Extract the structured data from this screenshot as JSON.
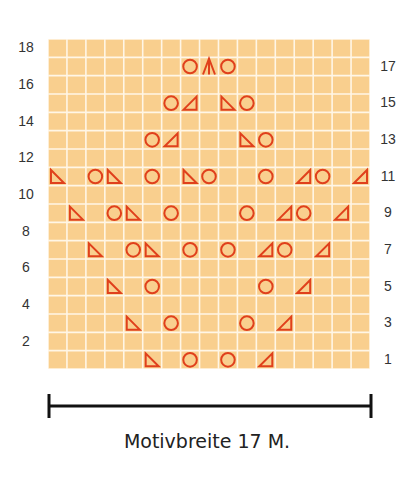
{
  "chart": {
    "columns": 17,
    "rows": 18,
    "colors": {
      "background": "#f9cf8e",
      "grid": "#fff6e6",
      "symbol": "#e0401c"
    },
    "left_labels": [
      "2",
      "4",
      "6",
      "8",
      "10",
      "12",
      "14",
      "16",
      "18"
    ],
    "right_labels": [
      "1",
      "3",
      "5",
      "7",
      "9",
      "11",
      "13",
      "15",
      "17"
    ],
    "legend_symbols": {
      "O": "yarn-over",
      "R": "right-leaning-decrease (◺)",
      "L": "left-leaning-decrease (◿)",
      "A": "double-decrease (Λ)"
    },
    "symbol_rows": [
      {
        "row": 1,
        "cells": [
          [
            6,
            "R"
          ],
          [
            8,
            "O"
          ],
          [
            10,
            "O"
          ],
          [
            12,
            "L"
          ]
        ]
      },
      {
        "row": 3,
        "cells": [
          [
            5,
            "R"
          ],
          [
            7,
            "O"
          ],
          [
            11,
            "O"
          ],
          [
            13,
            "L"
          ]
        ]
      },
      {
        "row": 5,
        "cells": [
          [
            4,
            "R"
          ],
          [
            6,
            "O"
          ],
          [
            12,
            "O"
          ],
          [
            14,
            "L"
          ]
        ]
      },
      {
        "row": 7,
        "cells": [
          [
            3,
            "R"
          ],
          [
            5,
            "O"
          ],
          [
            6,
            "R"
          ],
          [
            8,
            "O"
          ],
          [
            10,
            "O"
          ],
          [
            12,
            "L"
          ],
          [
            13,
            "O"
          ],
          [
            15,
            "L"
          ]
        ]
      },
      {
        "row": 9,
        "cells": [
          [
            2,
            "R"
          ],
          [
            4,
            "O"
          ],
          [
            5,
            "R"
          ],
          [
            7,
            "O"
          ],
          [
            11,
            "O"
          ],
          [
            13,
            "L"
          ],
          [
            14,
            "O"
          ],
          [
            16,
            "L"
          ]
        ]
      },
      {
        "row": 11,
        "cells": [
          [
            1,
            "R"
          ],
          [
            3,
            "O"
          ],
          [
            4,
            "R"
          ],
          [
            6,
            "O"
          ],
          [
            8,
            "R"
          ],
          [
            9,
            "O"
          ],
          [
            12,
            "O"
          ],
          [
            14,
            "L"
          ],
          [
            15,
            "O"
          ],
          [
            17,
            "L"
          ]
        ]
      },
      {
        "row": 13,
        "cells": [
          [
            6,
            "O"
          ],
          [
            7,
            "L"
          ],
          [
            11,
            "R"
          ],
          [
            12,
            "O"
          ]
        ]
      },
      {
        "row": 15,
        "cells": [
          [
            7,
            "O"
          ],
          [
            8,
            "L"
          ],
          [
            10,
            "R"
          ],
          [
            11,
            "O"
          ]
        ]
      },
      {
        "row": 17,
        "cells": [
          [
            8,
            "O"
          ],
          [
            9,
            "A"
          ],
          [
            10,
            "O"
          ]
        ]
      }
    ]
  },
  "caption": "Motivbreite 17 M."
}
